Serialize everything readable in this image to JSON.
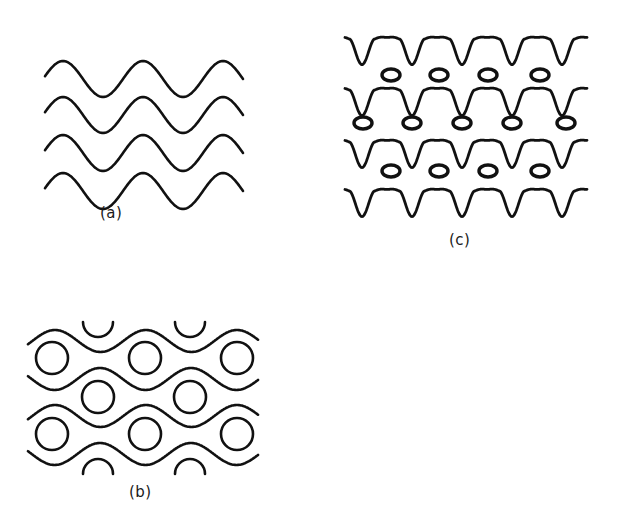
{
  "figure": {
    "panels": [
      {
        "id": "a",
        "label": "(a)",
        "description": "Four parallel sinusoidal wavy lines",
        "label_pos": [
          100,
          204
        ],
        "waves": {
          "x_start": 45,
          "x_end": 243,
          "wavelength": 80,
          "amplitude": 18,
          "phase_x_crest": 63,
          "row_midlines": [
            79,
            115,
            153,
            191
          ]
        }
      },
      {
        "id": "b",
        "label": "(b)",
        "description": "Wavy lines alternating with rows of circles in the gaps",
        "label_pos": [
          129,
          483
        ],
        "waves": {
          "x_start": 28,
          "x_end": 258,
          "wavelength": 91,
          "amplitude": 11,
          "lines": [
            {
              "mid": 341,
              "crest_x": 55
            },
            {
              "mid": 379,
              "crest_x": 100
            },
            {
              "mid": 416,
              "crest_x": 55
            },
            {
              "mid": 454,
              "crest_x": 100
            }
          ]
        },
        "circles": {
          "radius": 16,
          "rows": [
            {
              "y": 358,
              "xs": [
                52,
                145,
                237
              ]
            },
            {
              "y": 397,
              "xs": [
                98,
                190
              ]
            },
            {
              "y": 434,
              "xs": [
                52,
                145,
                237
              ]
            }
          ]
        },
        "half_arcs_top": {
          "y": 322,
          "xs": [
            98,
            190
          ],
          "radius": 15
        },
        "half_arcs_bottom": {
          "y": 474,
          "xs": [
            98,
            190
          ],
          "radius": 15
        }
      },
      {
        "id": "c",
        "label": "(c)",
        "description": "Spiky wavy lines forming a lattice with small ellipses in the cells",
        "label_pos": [
          449,
          231
        ],
        "waves": {
          "x_start": 345,
          "x_end": 587,
          "period": 50,
          "first_peak_x": 387,
          "rows": [
            {
              "mid": 45
            },
            {
              "mid": 96
            },
            {
              "mid": 148
            },
            {
              "mid": 197
            }
          ]
        },
        "ellipses": {
          "rx": 9,
          "ry": 6,
          "rows": [
            {
              "y": 75,
              "xs": [
                391,
                439,
                488,
                540
              ]
            },
            {
              "y": 123,
              "xs": [
                363,
                412,
                462,
                512,
                566
              ]
            },
            {
              "y": 171,
              "xs": [
                391,
                439,
                488,
                540
              ]
            }
          ]
        }
      }
    ],
    "stroke_color": "#111111",
    "background": "#ffffff"
  }
}
